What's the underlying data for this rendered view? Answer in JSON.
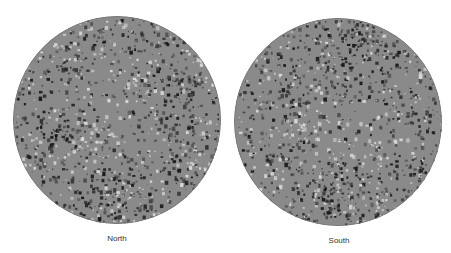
{
  "panels": [
    {
      "label": "North",
      "cx": 117,
      "cy": 120,
      "r": 104,
      "seed": 7,
      "dark_clusters": [
        [
          150,
          80,
          30
        ],
        [
          90,
          170,
          28
        ],
        [
          40,
          120,
          18
        ],
        [
          180,
          190,
          16
        ],
        [
          60,
          40,
          20
        ],
        [
          160,
          150,
          18
        ]
      ],
      "light_clusters": [
        [
          80,
          120,
          20
        ],
        [
          130,
          60,
          18
        ],
        [
          110,
          190,
          16
        ]
      ]
    },
    {
      "label": "South",
      "cx": 338,
      "cy": 122,
      "r": 104,
      "seed": 23,
      "dark_clusters": [
        [
          120,
          40,
          32
        ],
        [
          95,
          175,
          30
        ],
        [
          40,
          140,
          16
        ],
        [
          180,
          155,
          16
        ],
        [
          60,
          70,
          18
        ],
        [
          170,
          100,
          14
        ]
      ],
      "light_clusters": [
        [
          120,
          130,
          26
        ],
        [
          140,
          180,
          20
        ],
        [
          70,
          110,
          18
        ]
      ]
    }
  ],
  "colors": {
    "base": "#8a8a8a",
    "dark": "#1a1a1a",
    "mid_dark": "#4a4a4a",
    "light": "#d8d8d8",
    "rim": "#7a7a7a"
  }
}
